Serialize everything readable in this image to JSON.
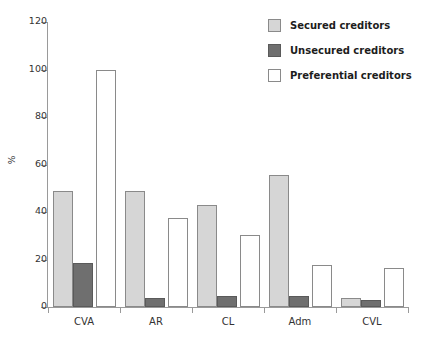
{
  "chart_data": {
    "type": "bar",
    "title": "",
    "xlabel": "",
    "ylabel": "%",
    "ylim": [
      0,
      120
    ],
    "yticks": [
      0,
      20,
      40,
      60,
      80,
      100,
      120
    ],
    "grid": false,
    "legend_position": "top-right",
    "categories": [
      "CVA",
      "AR",
      "CL",
      "Adm",
      "CVL"
    ],
    "series": [
      {
        "name": "Secured creditors",
        "color": "#d6d6d6",
        "values": [
          49,
          49,
          43,
          55.5,
          4
        ]
      },
      {
        "name": "Unsecured creditors",
        "color": "#6f6f6f",
        "values": [
          18.5,
          4,
          4.5,
          4.5,
          3
        ]
      },
      {
        "name": "Preferential creditors",
        "color": "#ffffff",
        "values": [
          100,
          37.5,
          30.5,
          17.5,
          16.5
        ]
      }
    ]
  }
}
